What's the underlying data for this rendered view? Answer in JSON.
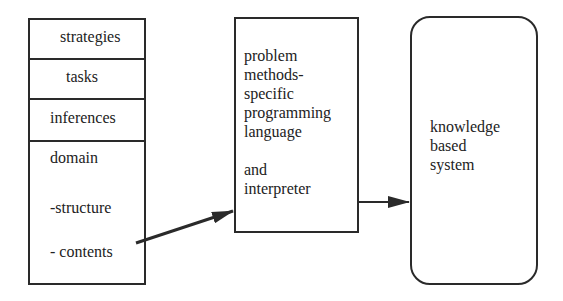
{
  "diagram": {
    "layers_box": {
      "items": [
        {
          "label": "strategies"
        },
        {
          "label": "tasks"
        },
        {
          "label": "inferences"
        }
      ],
      "domain": {
        "label": "domain",
        "sub": [
          "-structure",
          "- contents"
        ]
      }
    },
    "language_box": {
      "lines": [
        "problem",
        "methods-",
        "specific",
        "programming",
        "language",
        "",
        "and",
        "interpreter"
      ]
    },
    "system_box": {
      "lines": [
        "knowledge",
        "based",
        "system"
      ]
    },
    "arrows": [
      {
        "from": "domain-contents",
        "to": "language-box"
      },
      {
        "from": "language-box",
        "to": "system-box"
      }
    ],
    "colors": {
      "stroke": "#2a2a2a",
      "background": "#ffffff"
    }
  }
}
